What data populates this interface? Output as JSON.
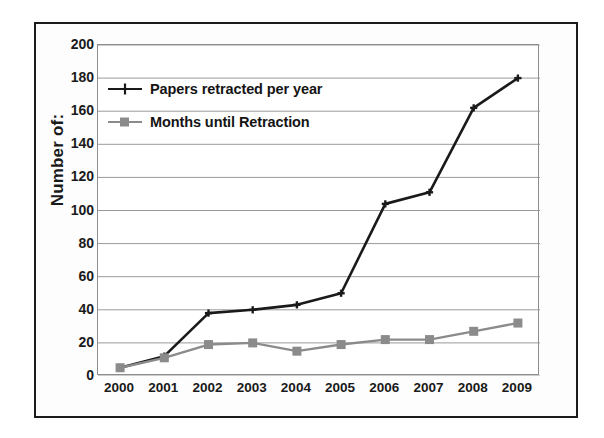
{
  "chart_data": {
    "type": "line",
    "title": "",
    "xlabel": "",
    "ylabel": "Number of:",
    "categories": [
      "2000",
      "2001",
      "2002",
      "2003",
      "2004",
      "2005",
      "2006",
      "2007",
      "2008",
      "2009"
    ],
    "x": [
      2000,
      2001,
      2002,
      2003,
      2004,
      2005,
      2006,
      2007,
      2008,
      2009
    ],
    "ylim": [
      0,
      200
    ],
    "ytick_labels": [
      "0",
      "20",
      "40",
      "60",
      "80",
      "100",
      "120",
      "140",
      "160",
      "180",
      "200"
    ],
    "ytick_values": [
      0,
      20,
      40,
      60,
      80,
      100,
      120,
      140,
      160,
      180,
      200
    ],
    "grid": true,
    "grid_axis": "y",
    "legend_position": "upper-left",
    "series": [
      {
        "name": "Papers retracted per year",
        "color": "#1a1a1a",
        "marker": "cross",
        "values": [
          5,
          12,
          38,
          40,
          43,
          50,
          104,
          111,
          162,
          180
        ]
      },
      {
        "name": "Months until Retraction",
        "color": "#8b8b8b",
        "marker": "square",
        "values": [
          5,
          11,
          19,
          20,
          15,
          19,
          22,
          22,
          27,
          32
        ]
      }
    ]
  },
  "axis": {
    "y_title": "Number of:"
  },
  "legend": {
    "items": [
      {
        "label": "Papers retracted per year"
      },
      {
        "label": "Months until Retraction"
      }
    ]
  },
  "colors": {
    "series_dark": "#1a1a1a",
    "series_gray": "#8b8b8b",
    "gridline": "#9a9a9a",
    "frame": "#1b1b1b",
    "background": "#ffffff"
  }
}
